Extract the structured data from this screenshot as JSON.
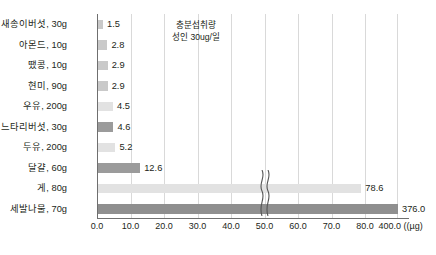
{
  "chart_data": {
    "type": "bar",
    "orientation": "horizontal",
    "title": "",
    "xlabel": "(µg)",
    "ylabel": "",
    "categories": [
      "새송이버섯, 30g",
      "아몬드, 10g",
      "땠콩, 10g",
      "현미, 90g",
      "우유, 200g",
      "느타리버섯, 30g",
      "두유, 200g",
      "달걀, 60g",
      "게, 80g",
      "세발나물, 70g"
    ],
    "values": [
      1.5,
      2.8,
      2.9,
      2.9,
      4.5,
      4.6,
      5.2,
      12.6,
      78.6,
      376.0
    ],
    "value_labels": [
      "1.5",
      "2.8",
      "2.9",
      "2.9",
      "4.5",
      "4.6",
      "5.2",
      "12.6",
      "78.6",
      "376.0"
    ],
    "bar_shades": [
      "mid",
      "mid",
      "mid",
      "mid",
      "light",
      "dark",
      "light",
      "dark",
      "light",
      "darker"
    ],
    "xticks": [
      0.0,
      10.0,
      20.0,
      30.0,
      40.0,
      50.0,
      60.0,
      70.0,
      80.0,
      400.0
    ],
    "xtick_labels": [
      "0.0",
      "10.0",
      "20.0",
      "30.0",
      "40.0",
      "50.0",
      "60.0",
      "70.0",
      "80.0",
      "400.0"
    ],
    "unit_label": "((µg)",
    "xlim": [
      0.0,
      80.0
    ],
    "axis_break": {
      "present": true,
      "after": 80.0,
      "resumes_at": 400.0
    },
    "grid": true,
    "legend": "none",
    "annotation": {
      "line1": "충분섭취량",
      "line2": "성인 30ug/일",
      "at_value": 30.0
    },
    "colors": {
      "bar_light": "#e2e2e2",
      "bar_mid": "#c9c9c9",
      "bar_dark": "#9b9b9b",
      "bar_darker": "#8f8f8f",
      "grid": "#d9d9d9",
      "axis": "#6f6f6f",
      "text": "#231f20",
      "background": "#ffffff"
    }
  }
}
